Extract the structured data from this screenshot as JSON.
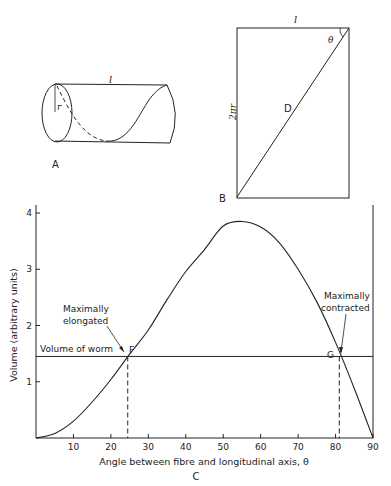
{
  "panel_a": {
    "label": "A",
    "length_label": "l",
    "radius_label": "r"
  },
  "panel_b": {
    "label": "B",
    "top_label": "l",
    "side_label": "2πr",
    "angle_label": "θ",
    "diagonal_label": "D"
  },
  "panel_c": {
    "label": "C",
    "annotations": {
      "volume_line": "Volume of worm",
      "f_label": "F",
      "g_label": "G",
      "elongated_line1": "Maximally",
      "elongated_line2": "elongated",
      "contracted_line1": "Maximally",
      "contracted_line2": "contracted"
    }
  },
  "chart_data": {
    "type": "line",
    "title": "",
    "xlabel": "Angle between fibre and longitudinal axis, θ",
    "ylabel": "Volume (arbitrary units)",
    "xlim": [
      0,
      90
    ],
    "ylim": [
      0,
      4
    ],
    "x_ticks": [
      10,
      20,
      30,
      40,
      50,
      60,
      70,
      80,
      90
    ],
    "y_ticks": [
      1,
      2,
      3,
      4
    ],
    "grid": false,
    "series": [
      {
        "name": "Volume vs fibre angle",
        "x": [
          0,
          5,
          10,
          15,
          20,
          25,
          30,
          35,
          40,
          45,
          50,
          55,
          60,
          65,
          70,
          75,
          80,
          85,
          90
        ],
        "values": [
          0,
          0.08,
          0.3,
          0.64,
          1.04,
          1.49,
          1.92,
          2.46,
          2.96,
          3.35,
          3.77,
          3.85,
          3.75,
          3.47,
          3.0,
          2.42,
          1.7,
          0.88,
          0
        ]
      },
      {
        "name": "Volume of worm",
        "x": [
          0,
          90
        ],
        "values": [
          1.45,
          1.45
        ]
      }
    ],
    "points": [
      {
        "name": "F",
        "x": 24.5,
        "y": 1.45,
        "note": "Maximally elongated"
      },
      {
        "name": "G",
        "x": 81,
        "y": 1.45,
        "note": "Maximally contracted"
      }
    ],
    "peak": {
      "x": 54.7,
      "y": 3.85
    }
  }
}
